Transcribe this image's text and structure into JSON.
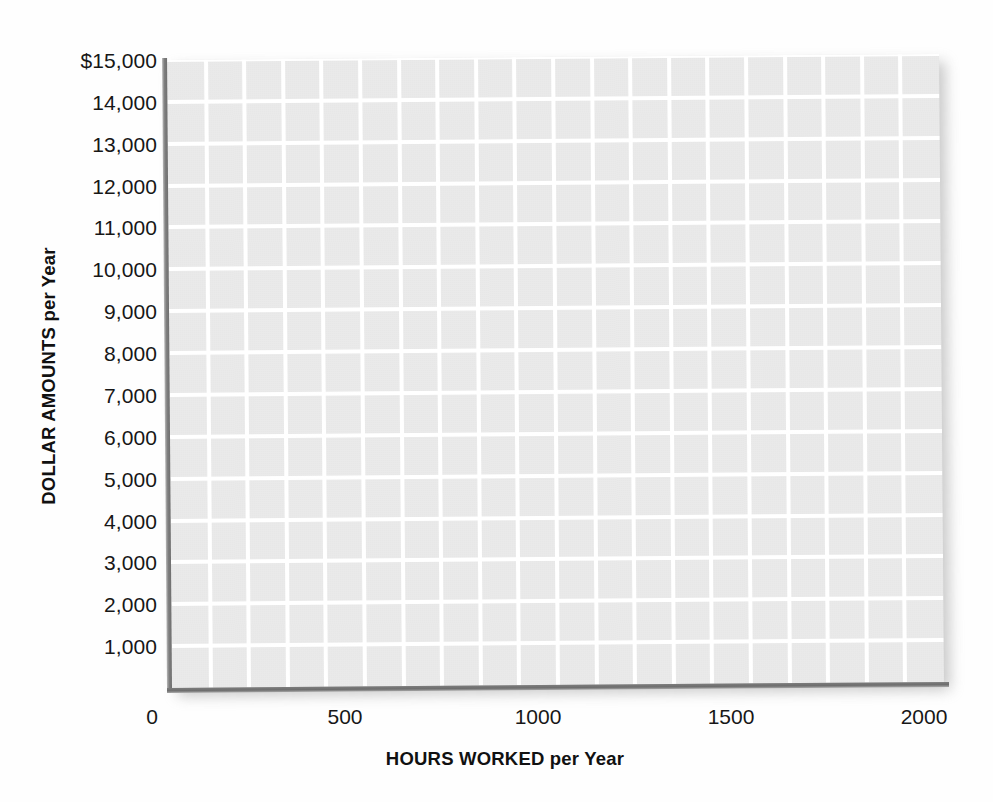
{
  "chart_data": {
    "type": "line",
    "title": "",
    "subtitle": "",
    "xlabel_prefix": "HOURS WORKED",
    "xlabel_suffix": " per Year",
    "ylabel_prefix": "DOLLAR AMOUNTS",
    "ylabel_suffix": " per Year",
    "xlabel": "HOURS WORKED per Year",
    "ylabel": "DOLLAR AMOUNTS per Year",
    "xlim": [
      0,
      2000
    ],
    "ylim": [
      0,
      15000
    ],
    "xticks": [
      0,
      500,
      1000,
      1500,
      2000
    ],
    "xtick_labels": [
      "0",
      "500",
      "1000",
      "1500",
      "2000"
    ],
    "yticks": [
      1000,
      2000,
      3000,
      4000,
      5000,
      6000,
      7000,
      8000,
      9000,
      10000,
      11000,
      12000,
      13000,
      14000,
      15000
    ],
    "ytick_labels": [
      "1,000",
      "2,000",
      "3,000",
      "4,000",
      "5,000",
      "6,000",
      "7,000",
      "8,000",
      "9,000",
      "10,000",
      "11,000",
      "12,000",
      "13,000",
      "14,000",
      "$15,000"
    ],
    "grid": true,
    "grid_color": "#ffffff",
    "grid_vertical_count": 20,
    "grid_horizontal_count": 15,
    "plot_background": "#e7e7e7",
    "axis_color": "#757575",
    "legend": [],
    "series": [],
    "annotations": [],
    "note": "Blank worksheet grid — no data series plotted"
  },
  "figure": {
    "background": "#fefefe",
    "text_color": "#171717"
  }
}
